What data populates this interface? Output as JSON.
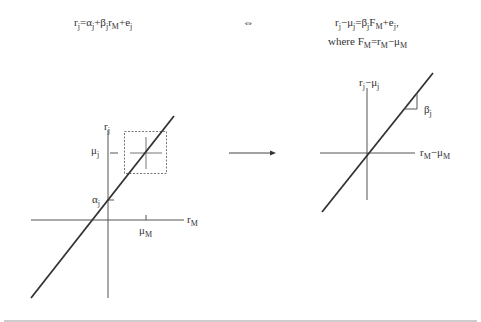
{
  "equations": {
    "left": {
      "r": "r",
      "r_sub": "j",
      "eq": "=",
      "alpha": "α",
      "alpha_sub": "j",
      "plus1": "+",
      "beta": "β",
      "beta_sub": "j",
      "r2": "r",
      "r2_sub": "M",
      "plus2": "+",
      "e": "e",
      "e_sub": "j"
    },
    "iff": "⇔",
    "right_line1": {
      "r": "r",
      "r_sub": "j",
      "minus": "−",
      "mu": "μ",
      "mu_sub": "j",
      "eq": "=",
      "beta": "β",
      "beta_sub": "j",
      "F": "F",
      "F_sub": "M",
      "plus": "+",
      "e": "e",
      "e_sub": "j",
      "comma": ","
    },
    "right_line2": {
      "where": "where ",
      "F": "F",
      "F_sub": "M",
      "eq": "=",
      "r": "r",
      "r_sub": "M",
      "minus": "−",
      "mu": "μ",
      "mu_sub": "M"
    }
  },
  "left_plot": {
    "y_axis": {
      "name": "r",
      "sub": "j"
    },
    "x_axis": {
      "name": "r",
      "sub": "M"
    },
    "mu_j": {
      "name": "μ",
      "sub": "j"
    },
    "alpha_j": {
      "name": "α",
      "sub": "j"
    },
    "mu_M": {
      "name": "μ",
      "sub": "M"
    }
  },
  "right_plot": {
    "y_axis": {
      "name": "r",
      "sub": "j",
      "minus": "−",
      "mu": "μ",
      "mu_sub": "j"
    },
    "x_axis": {
      "name": "r",
      "sub": "M",
      "minus": "−",
      "mu": "μ",
      "mu_sub": "M"
    },
    "slope": {
      "name": "β",
      "sub": "j"
    }
  },
  "colors": {
    "line": "#333333",
    "axis": "#555555",
    "divider": "#888888"
  }
}
